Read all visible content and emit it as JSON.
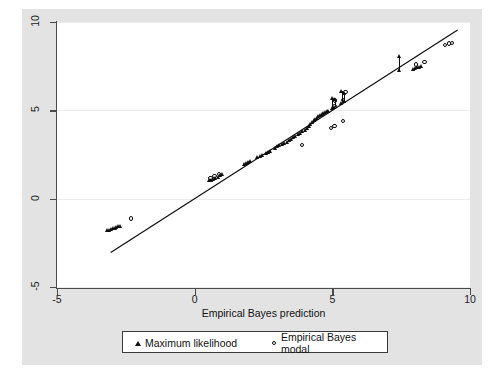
{
  "figure": {
    "background_color": "#ffffff",
    "graph_region_color": "#e3e3e3",
    "plot_panel_color": "#ffffff",
    "axis_color": "#4a4a4a",
    "grid_color": "#ececec",
    "marker_color": "#0d0d0d"
  },
  "chart_data": {
    "type": "scatter",
    "title": "",
    "xlabel": "Empirical Bayes prediction",
    "ylabel": "",
    "xlim": [
      -5,
      10
    ],
    "ylim": [
      -5,
      10
    ],
    "xticks": [
      -5,
      0,
      5,
      10
    ],
    "yticks": [
      -5,
      0,
      5,
      10
    ],
    "xticklabels": [
      "-5",
      "0",
      "5",
      "10"
    ],
    "yticklabels": [
      "-5",
      "0",
      "5",
      "10"
    ],
    "grid": "horizontal",
    "legend_position": "below-axis",
    "reference_line": {
      "kind": "identity",
      "slope": 1,
      "intercept": 0,
      "x_start": -3.05,
      "x_end": 9.55,
      "color": "#0d0d0d"
    },
    "series": [
      {
        "name": "Maximum likelihood",
        "marker": "triangle-filled",
        "points": [
          [
            -3.15,
            -1.8
          ],
          [
            -3.08,
            -1.78
          ],
          [
            -3.02,
            -1.74
          ],
          [
            -2.95,
            -1.7
          ],
          [
            -2.88,
            -1.66
          ],
          [
            -2.82,
            -1.62
          ],
          [
            -2.76,
            -1.58
          ],
          [
            -2.7,
            -1.55
          ],
          [
            0.55,
            1.02
          ],
          [
            0.62,
            1.06
          ],
          [
            0.7,
            1.1
          ],
          [
            0.78,
            1.15
          ],
          [
            0.86,
            1.22
          ],
          [
            0.94,
            1.3
          ],
          [
            1.0,
            1.38
          ],
          [
            1.8,
            1.95
          ],
          [
            1.88,
            2.0
          ],
          [
            1.96,
            2.05
          ],
          [
            2.04,
            2.1
          ],
          [
            2.3,
            2.32
          ],
          [
            2.38,
            2.38
          ],
          [
            2.46,
            2.44
          ],
          [
            2.6,
            2.56
          ],
          [
            2.68,
            2.62
          ],
          [
            2.76,
            2.7
          ],
          [
            2.95,
            2.88
          ],
          [
            3.02,
            2.94
          ],
          [
            3.1,
            3.0
          ],
          [
            3.18,
            3.06
          ],
          [
            3.28,
            3.14
          ],
          [
            3.36,
            3.22
          ],
          [
            3.44,
            3.3
          ],
          [
            3.52,
            3.38
          ],
          [
            3.6,
            3.46
          ],
          [
            3.68,
            3.54
          ],
          [
            3.78,
            3.62
          ],
          [
            3.86,
            3.7
          ],
          [
            3.94,
            3.8
          ],
          [
            4.02,
            3.9
          ],
          [
            4.1,
            4.0
          ],
          [
            4.16,
            4.1
          ],
          [
            4.22,
            4.22
          ],
          [
            4.28,
            4.32
          ],
          [
            4.34,
            4.42
          ],
          [
            4.4,
            4.5
          ],
          [
            4.46,
            4.58
          ],
          [
            4.52,
            4.64
          ],
          [
            4.58,
            4.7
          ],
          [
            4.64,
            4.76
          ],
          [
            4.7,
            4.82
          ],
          [
            4.76,
            4.88
          ],
          [
            4.82,
            4.92
          ],
          [
            4.88,
            4.96
          ],
          [
            5.0,
            5.1
          ],
          [
            5.0,
            5.7
          ],
          [
            5.1,
            5.18
          ],
          [
            5.1,
            5.62
          ],
          [
            5.35,
            5.42
          ],
          [
            5.35,
            6.1
          ],
          [
            5.45,
            5.5
          ],
          [
            5.45,
            5.95
          ],
          [
            7.45,
            7.28
          ],
          [
            7.45,
            8.05
          ],
          [
            7.95,
            7.35
          ],
          [
            8.02,
            7.38
          ],
          [
            8.1,
            7.42
          ],
          [
            8.18,
            7.46
          ],
          [
            8.26,
            7.5
          ]
        ]
      },
      {
        "name": "Empirical Bayes modal",
        "marker": "circle-open",
        "points": [
          [
            -2.32,
            -1.12
          ],
          [
            0.58,
            1.18
          ],
          [
            0.72,
            1.28
          ],
          [
            0.88,
            1.4
          ],
          [
            3.9,
            3.05
          ],
          [
            4.95,
            4.0
          ],
          [
            5.08,
            4.12
          ],
          [
            5.38,
            4.4
          ],
          [
            5.08,
            5.22
          ],
          [
            5.1,
            5.55
          ],
          [
            5.4,
            5.58
          ],
          [
            5.48,
            6.05
          ],
          [
            8.05,
            7.6
          ],
          [
            8.35,
            7.72
          ],
          [
            9.1,
            8.68
          ],
          [
            9.25,
            8.78
          ],
          [
            9.35,
            8.82
          ]
        ]
      }
    ]
  },
  "legend": {
    "items": [
      {
        "label": "Maximum likelihood",
        "marker": "triangle-filled"
      },
      {
        "label": "Empirical Bayes modal",
        "marker": "circle-open"
      }
    ]
  }
}
